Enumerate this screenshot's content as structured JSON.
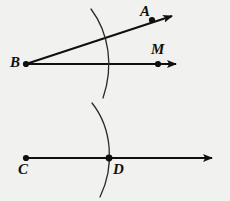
{
  "figure": {
    "background_color": "#f1f1ef",
    "ink_color": "#101010",
    "width": 230,
    "height": 201
  },
  "labels": {
    "a": "A",
    "b": "B",
    "m": "M",
    "c": "C",
    "d": "D"
  },
  "points": [
    {
      "name": "A",
      "label": "A",
      "x": 152,
      "y": 20,
      "label_x": 142,
      "label_y": 6
    },
    {
      "name": "B",
      "label": "B",
      "x": 26,
      "y": 64,
      "label_x": 12,
      "label_y": 56
    },
    {
      "name": "M",
      "label": "M",
      "x": 158,
      "y": 64,
      "label_x": 152,
      "label_y": 44
    },
    {
      "name": "C",
      "label": "C",
      "x": 26,
      "y": 158,
      "label_x": 19,
      "label_y": 163
    },
    {
      "name": "D",
      "label": "D",
      "x": 109,
      "y": 158,
      "label_x": 113,
      "label_y": 163
    }
  ],
  "rays": [
    {
      "name": "ray-BA",
      "from": "B",
      "through": "A",
      "x1": 26,
      "y1": 64,
      "x2": 174,
      "y2": 16
    },
    {
      "name": "ray-BM",
      "from": "B",
      "through": "M",
      "x1": 26,
      "y1": 64,
      "x2": 178,
      "y2": 64
    },
    {
      "name": "ray-CD",
      "from": "C",
      "through": "D",
      "x1": 26,
      "y1": 158,
      "x2": 214,
      "y2": 158
    }
  ],
  "arcs": [
    {
      "name": "arc-upper",
      "path": "M 91 9 C 109 33, 114 66, 103 98",
      "center": "B",
      "crosses": [
        "ray-BA",
        "ray-BM"
      ]
    },
    {
      "name": "arc-lower",
      "path": "M 92 103 C 112 128, 115 166, 100 197",
      "center": "C",
      "crosses": [
        "ray-CD"
      ]
    }
  ]
}
